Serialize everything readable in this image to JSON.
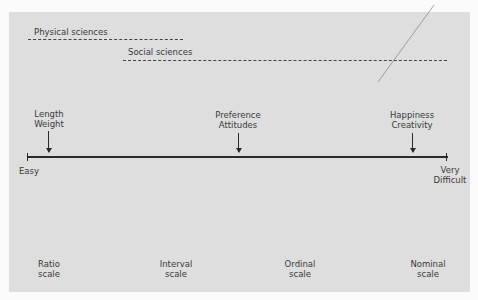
{
  "disciplines": [
    {
      "label": "Physical sciences"
    },
    {
      "label": "Social sciences"
    }
  ],
  "axis": {
    "start_label": "Easy",
    "end_label_line1": "Very",
    "end_label_line2": "Difficult"
  },
  "examples": [
    {
      "line1": "Length",
      "line2": "Weight"
    },
    {
      "line1": "Preference",
      "line2": "Attitudes"
    },
    {
      "line1": "Happiness",
      "line2": "Creativity"
    }
  ],
  "scales": [
    {
      "line1": "Ratio",
      "line2": "scale"
    },
    {
      "line1": "Interval",
      "line2": "scale"
    },
    {
      "line1": "Ordinal",
      "line2": "scale"
    },
    {
      "line1": "Nominal",
      "line2": "scale"
    }
  ]
}
